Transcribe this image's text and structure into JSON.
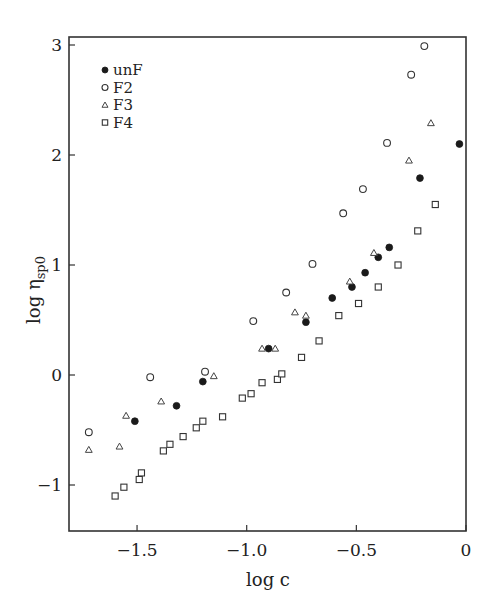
{
  "chart_data": {
    "type": "scatter",
    "title": "",
    "xlabel": "log c",
    "ylabel": "log η",
    "ylabel_subscript": "sp0",
    "xlim": [
      -1.8,
      0
    ],
    "ylim": [
      -1.42,
      3.07
    ],
    "xticks": [
      -1.5,
      -1.0,
      -0.5,
      0
    ],
    "xtick_labels": [
      "−1.5",
      "−1.0",
      "−0.5",
      "0"
    ],
    "yticks": [
      -1,
      0,
      1,
      2,
      3
    ],
    "ytick_labels": [
      "−1",
      "0",
      "1",
      "2",
      "3"
    ],
    "grid": false,
    "legend_position": "upper left",
    "series": [
      {
        "name": "unF",
        "marker": "filled-circle",
        "color": "#1a1a1a",
        "x": [
          -1.51,
          -1.32,
          -1.2,
          -0.9,
          -0.73,
          -0.61,
          -0.52,
          -0.46,
          -0.4,
          -0.35,
          -0.21,
          -0.03
        ],
        "y": [
          -0.42,
          -0.28,
          -0.06,
          0.24,
          0.48,
          0.7,
          0.8,
          0.93,
          1.07,
          1.16,
          1.79,
          2.1
        ]
      },
      {
        "name": "F2",
        "marker": "open-circle",
        "color": "#1a1a1a",
        "x": [
          -1.72,
          -1.44,
          -1.19,
          -0.97,
          -0.82,
          -0.7,
          -0.56,
          -0.47,
          -0.36,
          -0.25,
          -0.19
        ],
        "y": [
          -0.52,
          -0.02,
          0.03,
          0.49,
          0.75,
          1.01,
          1.47,
          1.69,
          2.11,
          2.73,
          2.99
        ]
      },
      {
        "name": "F3",
        "marker": "open-triangle",
        "color": "#1a1a1a",
        "x": [
          -1.72,
          -1.58,
          -1.55,
          -1.39,
          -1.15,
          -0.93,
          -0.87,
          -0.78,
          -0.73,
          -0.53,
          -0.42,
          -0.26,
          -0.16
        ],
        "y": [
          -0.68,
          -0.65,
          -0.37,
          -0.24,
          -0.01,
          0.24,
          0.24,
          0.57,
          0.54,
          0.85,
          1.11,
          1.95,
          2.29
        ]
      },
      {
        "name": "F4",
        "marker": "open-square",
        "color": "#1a1a1a",
        "x": [
          -1.6,
          -1.56,
          -1.49,
          -1.48,
          -1.38,
          -1.35,
          -1.29,
          -1.23,
          -1.2,
          -1.11,
          -1.02,
          -0.98,
          -0.93,
          -0.86,
          -0.84,
          -0.75,
          -0.67,
          -0.58,
          -0.49,
          -0.4,
          -0.31,
          -0.22,
          -0.14
        ],
        "y": [
          -1.1,
          -1.02,
          -0.95,
          -0.89,
          -0.69,
          -0.63,
          -0.56,
          -0.48,
          -0.42,
          -0.38,
          -0.21,
          -0.17,
          -0.07,
          -0.04,
          0.01,
          0.16,
          0.31,
          0.54,
          0.65,
          0.8,
          1.0,
          1.31,
          1.55
        ]
      }
    ]
  },
  "legend": {
    "items": [
      {
        "label": "unF",
        "marker": "filled-circle"
      },
      {
        "label": "F2",
        "marker": "open-circle"
      },
      {
        "label": "F3",
        "marker": "open-triangle"
      },
      {
        "label": "F4",
        "marker": "open-square"
      }
    ]
  },
  "axes": {
    "x_label": "log c",
    "y_label_main": "log η",
    "y_label_sub": "sp0"
  }
}
